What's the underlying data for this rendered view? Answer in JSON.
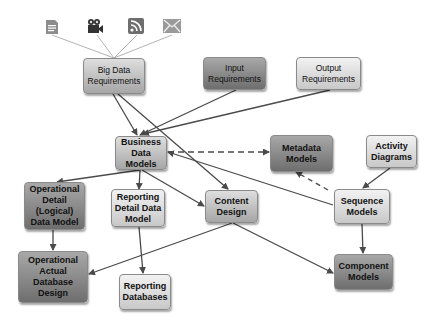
{
  "diagram": {
    "icons": [
      {
        "name": "document-icon"
      },
      {
        "name": "video-camera-icon"
      },
      {
        "name": "rss-feed-icon"
      },
      {
        "name": "email-icon"
      }
    ],
    "nodes": {
      "big_data": {
        "label": "Big Data Requirements",
        "line1": "Big Data",
        "line2": "Requirements"
      },
      "input": {
        "line1": "Input",
        "line2": "Requirements"
      },
      "output": {
        "line1": "Output",
        "line2": "Requirements"
      },
      "business": {
        "line1": "Business",
        "line2": "Data",
        "line3": "Models"
      },
      "metadata": {
        "line1": "Metadata",
        "line2": "Models"
      },
      "activity": {
        "line1": "Activity",
        "line2": "Diagrams"
      },
      "op_detail": {
        "line1": "Operational",
        "line2": "Detail",
        "line3": "(Logical)",
        "line4": "Data Model"
      },
      "rep_detail": {
        "line1": "Reporting",
        "line2": "Detail Data",
        "line3": "Model"
      },
      "content": {
        "line1": "Content",
        "line2": "Design"
      },
      "sequence": {
        "line1": "Sequence",
        "line2": "Models"
      },
      "op_actual": {
        "line1": "Operational",
        "line2": "Actual",
        "line3": "Database",
        "line4": "Design"
      },
      "rep_db": {
        "line1": "Reporting",
        "line2": "Databases"
      },
      "component": {
        "line1": "Component",
        "line2": "Models"
      }
    },
    "colors": {
      "edge": "#4a4a4a",
      "icon_line": "#9a9a9a"
    }
  }
}
